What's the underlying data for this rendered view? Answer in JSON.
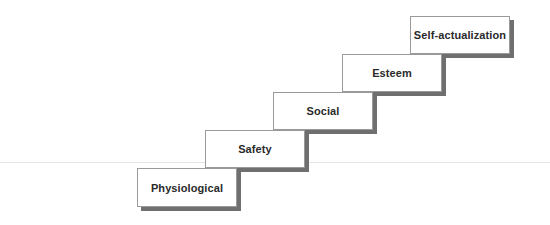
{
  "diagram": {
    "type": "staircase",
    "title": "",
    "steps": [
      {
        "label": "Physiological",
        "level": 1
      },
      {
        "label": "Safety",
        "level": 2
      },
      {
        "label": "Social",
        "level": 3
      },
      {
        "label": "Esteem",
        "level": 4
      },
      {
        "label": "Self-actualization",
        "level": 5
      }
    ],
    "colors": {
      "box_fill": "#ffffff",
      "box_border": "#9a9a9a",
      "shadow": "#6f6f6f",
      "text": "#2a2a2a",
      "baseline": "#e4e4e4"
    }
  }
}
